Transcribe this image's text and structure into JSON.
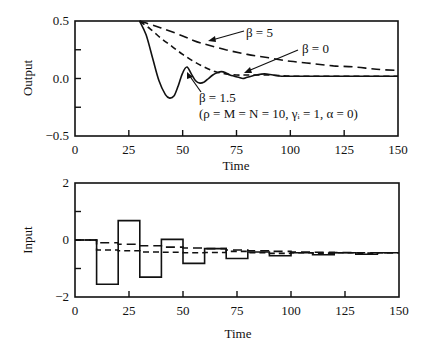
{
  "chart_data": [
    {
      "type": "line",
      "name": "output-plot",
      "title": "",
      "xlabel": "Time",
      "ylabel": "Output",
      "xlim": [
        0,
        150
      ],
      "ylim": [
        -0.5,
        0.5
      ],
      "xticks": [
        0,
        25,
        50,
        75,
        100,
        125,
        150
      ],
      "xtick_labels": [
        "0",
        "25",
        "50",
        "75",
        "100",
        "125",
        "150"
      ],
      "yticks": [
        -0.5,
        -0.25,
        0.0,
        0.25,
        0.5
      ],
      "ytick_labels": [
        "−0.5",
        "",
        "0.0",
        "",
        "0.5"
      ],
      "grid": false,
      "series": [
        {
          "name": "β = 1.5",
          "style": "solid",
          "x": [
            30,
            33,
            36,
            39,
            42,
            44,
            46,
            48,
            50,
            52,
            54,
            56,
            58,
            60,
            62,
            64,
            66,
            68,
            70,
            72,
            74,
            76,
            78,
            80,
            84,
            88,
            92,
            96,
            100,
            110,
            120,
            130,
            140,
            150
          ],
          "y": [
            0.5,
            0.38,
            0.18,
            -0.02,
            -0.14,
            -0.17,
            -0.15,
            -0.06,
            0.05,
            0.1,
            0.04,
            -0.02,
            -0.04,
            -0.03,
            0.0,
            0.03,
            0.05,
            0.06,
            0.05,
            0.03,
            0.02,
            0.01,
            0.0,
            0.01,
            0.03,
            0.04,
            0.03,
            0.02,
            0.02,
            0.02,
            0.02,
            0.02,
            0.02,
            0.02
          ]
        },
        {
          "name": "β = 0",
          "style": "dashed",
          "x": [
            30,
            35,
            40,
            45,
            50,
            55,
            60,
            65,
            70,
            75,
            80,
            90,
            100,
            110,
            120,
            130,
            140,
            150
          ],
          "y": [
            0.5,
            0.43,
            0.35,
            0.28,
            0.21,
            0.15,
            0.1,
            0.06,
            0.04,
            0.03,
            0.03,
            0.03,
            0.02,
            0.02,
            0.02,
            0.02,
            0.02,
            0.02
          ]
        },
        {
          "name": "β = 5",
          "style": "long-dashed",
          "x": [
            30,
            40,
            50,
            55,
            60,
            70,
            80,
            90,
            100,
            110,
            120,
            130,
            140,
            150
          ],
          "y": [
            0.5,
            0.44,
            0.37,
            0.33,
            0.3,
            0.25,
            0.21,
            0.18,
            0.15,
            0.13,
            0.11,
            0.1,
            0.08,
            0.07
          ]
        }
      ],
      "annotations": [
        {
          "text": "β = 5",
          "points_to_series": "β = 5"
        },
        {
          "text": "β = 0",
          "points_to_series": "β = 0"
        },
        {
          "text": "β = 1.5",
          "points_to_series": "β = 1.5"
        },
        {
          "text": "(ρ = M = N = 10, γᵢ = 1, α = 0)"
        }
      ]
    },
    {
      "type": "line",
      "name": "input-plot",
      "title": "",
      "xlabel": "Time",
      "ylabel": "Input",
      "xlim": [
        0,
        150
      ],
      "ylim": [
        -2,
        2
      ],
      "xticks": [
        0,
        25,
        50,
        75,
        100,
        125,
        150
      ],
      "xtick_labels": [
        "0",
        "25",
        "50",
        "75",
        "100",
        "125",
        "150"
      ],
      "yticks": [
        -2,
        -1,
        0,
        1,
        2
      ],
      "ytick_labels": [
        "−2",
        "",
        "0",
        "",
        "2"
      ],
      "grid": false,
      "step_width": 10,
      "series": [
        {
          "name": "β = 1.5",
          "style": "solid",
          "step_starts": [
            0,
            10,
            20,
            30,
            40,
            50,
            60,
            70,
            80,
            90,
            100,
            110,
            120,
            130,
            140
          ],
          "values": [
            0.0,
            -1.55,
            0.68,
            -1.3,
            0.02,
            -0.82,
            -0.3,
            -0.65,
            -0.42,
            -0.55,
            -0.45,
            -0.52,
            -0.45,
            -0.5,
            -0.45
          ]
        },
        {
          "name": "β = 0",
          "style": "dashed",
          "step_starts": [
            0,
            10,
            20,
            30,
            40,
            50,
            60,
            70,
            80,
            90,
            100,
            110,
            120,
            130,
            140
          ],
          "values": [
            0.0,
            -0.35,
            -0.38,
            -0.42,
            -0.43,
            -0.45,
            -0.44,
            -0.4,
            -0.45,
            -0.47,
            -0.45,
            -0.46,
            -0.45,
            -0.46,
            -0.45
          ]
        },
        {
          "name": "β = 5",
          "style": "long-dashed",
          "step_starts": [
            0,
            10,
            20,
            30,
            40,
            50,
            60,
            70,
            80,
            90,
            100,
            110,
            120,
            130,
            140
          ],
          "values": [
            0.0,
            -0.1,
            -0.15,
            -0.2,
            -0.25,
            -0.28,
            -0.3,
            -0.35,
            -0.38,
            -0.4,
            -0.42,
            -0.43,
            -0.44,
            -0.45,
            -0.45
          ]
        }
      ]
    }
  ]
}
